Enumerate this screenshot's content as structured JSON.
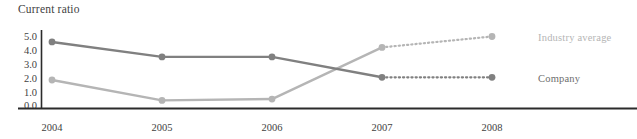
{
  "chart_data": {
    "type": "line",
    "title": "Current ratio",
    "xlabel": "",
    "ylabel": "",
    "categories": [
      "2004",
      "2005",
      "2006",
      "2007",
      "2008"
    ],
    "ylim": [
      0,
      5
    ],
    "yticks": [
      "0.0",
      "1.0",
      "2.0",
      "3.0",
      "4.0",
      "5.0"
    ],
    "grid": false,
    "legend_position": "right-of-last-point",
    "series": [
      {
        "name": "Industry average",
        "values": [
          1.8,
          0.3,
          0.4,
          4.2,
          5.0
        ],
        "color": "#b5b5b5",
        "solid_through_index": 3,
        "dotted_tail": true
      },
      {
        "name": "Company",
        "values": [
          4.6,
          3.5,
          3.5,
          2.0,
          2.0
        ],
        "color": "#808080",
        "solid_through_index": 3,
        "dotted_tail": true
      }
    ]
  },
  "axis": {
    "line_color": "#2b2b2b",
    "tick_color": "#3f3f3f"
  }
}
